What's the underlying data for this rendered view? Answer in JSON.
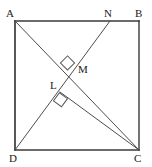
{
  "figure": {
    "type": "geometry-diagram",
    "shape": "square",
    "background_color": "#ffffff",
    "stroke_color": "#4d4d4d",
    "edge_color": "#3a3a3a",
    "label_color": "#1a1a1a",
    "canvas": {
      "width": 152,
      "height": 167
    },
    "square": {
      "name": "ABCD",
      "corners": [
        {
          "id": "A",
          "label": "A",
          "x": 15,
          "y": 21,
          "label_x": 6,
          "label_y": 8
        },
        {
          "id": "B",
          "label": "B",
          "x": 139,
          "y": 21,
          "label_x": 135,
          "label_y": 8
        },
        {
          "id": "C",
          "label": "C",
          "x": 139,
          "y": 150,
          "label_x": 134,
          "label_y": 153
        },
        {
          "id": "D",
          "label": "D",
          "x": 15,
          "y": 150,
          "label_x": 9,
          "label_y": 153
        }
      ],
      "edges": [
        {
          "id": "AB",
          "from": "A",
          "to": "B"
        },
        {
          "id": "BC",
          "from": "B",
          "to": "C"
        },
        {
          "id": "CD",
          "from": "C",
          "to": "D"
        },
        {
          "id": "DA",
          "from": "D",
          "to": "A"
        }
      ]
    },
    "points": [
      {
        "id": "N",
        "label": "N",
        "x": 110,
        "y": 21,
        "on": "AB",
        "label_x": 104,
        "label_y": 8
      },
      {
        "id": "M",
        "label": "M",
        "x": 76,
        "y": 63,
        "on": "AC-and-DN",
        "label_x": 78,
        "label_y": 64
      },
      {
        "id": "L",
        "label": "L",
        "x": 60,
        "y": 92,
        "on": "DN",
        "label_x": 50,
        "label_y": 80
      }
    ],
    "segments": [
      {
        "id": "AC",
        "from": "A",
        "to": "C",
        "label": "diagonal A to C"
      },
      {
        "id": "DN",
        "from": "D",
        "to": "N",
        "label": "segment D to N"
      },
      {
        "id": "LC",
        "from": "L",
        "to": "C",
        "label": "segment L to C"
      }
    ],
    "right_angle_marks": [
      {
        "id": "angle-at-M",
        "at": "M",
        "size": 9,
        "rotation": -20,
        "note": "right angle at M between AC and DN"
      },
      {
        "id": "angle-at-L",
        "at": "L",
        "size": 9,
        "rotation": -20,
        "note": "right angle at L between DN and LC"
      }
    ]
  }
}
